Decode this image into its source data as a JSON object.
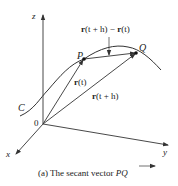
{
  "axes": {
    "z": "z",
    "y": "y",
    "x": "x",
    "origin": "0"
  },
  "curve_label": "C",
  "points": {
    "P": "P",
    "Q": "Q"
  },
  "vectors": {
    "r_t": "r(t)",
    "r_th": "r(t + h)",
    "diff": "r(t + h) − r(t)"
  },
  "vector_parts": {
    "r_bold": "r",
    "r_t_arg": "(t)",
    "r_th_arg": "(t + h)",
    "diff_arg1": "(t + h) − ",
    "diff_arg2": "(t)"
  },
  "caption": {
    "prefix": "(a) The secant vector ",
    "vector": "PQ"
  },
  "colors": {
    "line": "#333333",
    "text": "#222222",
    "background": "#ffffff"
  }
}
